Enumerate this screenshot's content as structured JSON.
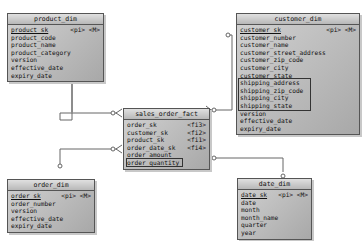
{
  "caption": "",
  "entities": {
    "product_dim": {
      "title": "product_dim",
      "rows": [
        {
          "name": "product_sk",
          "key": "<pi> <M>"
        },
        {
          "name": "product_code"
        },
        {
          "name": "product_name"
        },
        {
          "name": "product_category"
        },
        {
          "name": "version"
        },
        {
          "name": "effective_date"
        },
        {
          "name": "expiry_date"
        }
      ]
    },
    "customer_dim": {
      "title": "customer_dim",
      "rows": [
        {
          "name": "customer_sk",
          "key": "<pi> <M>"
        },
        {
          "name": "customer_number"
        },
        {
          "name": "customer_name"
        },
        {
          "name": "customer_street_address"
        },
        {
          "name": "customer_zip_code"
        },
        {
          "name": "customer_city"
        },
        {
          "name": "customer_state"
        },
        {
          "name": "shipping_address"
        },
        {
          "name": "shipping_zip_code"
        },
        {
          "name": "shipping_city"
        },
        {
          "name": "shipping_state"
        },
        {
          "name": "version"
        },
        {
          "name": "effective_date"
        },
        {
          "name": "expiry_date"
        }
      ]
    },
    "sales_order_fact": {
      "title": "sales_order_fact",
      "rows": [
        {
          "name": "order_sk",
          "key": "<fi3>"
        },
        {
          "name": "customer_sk",
          "key": "<fi2>"
        },
        {
          "name": "product_sk",
          "key": "<fi1>"
        },
        {
          "name": "order_date_sk",
          "key": "<fi4>"
        },
        {
          "name": "order_amount"
        },
        {
          "name": "order_quantity"
        }
      ]
    },
    "order_dim": {
      "title": "order_dim",
      "rows": [
        {
          "name": "order_sk",
          "key": "<pi> <M>"
        },
        {
          "name": "order_number"
        },
        {
          "name": "version"
        },
        {
          "name": "effective_date"
        },
        {
          "name": "expiry_date"
        }
      ]
    },
    "date_dim": {
      "title": "date_dim",
      "rows": [
        {
          "name": "date_sk",
          "key": "<pi> <M>"
        },
        {
          "name": "date"
        },
        {
          "name": "month"
        },
        {
          "name": "month_name"
        },
        {
          "name": "quarter"
        },
        {
          "name": "year"
        }
      ]
    }
  },
  "colors": {
    "border": "#555555",
    "line": "#666666",
    "fill": "#b8b8b8"
  }
}
